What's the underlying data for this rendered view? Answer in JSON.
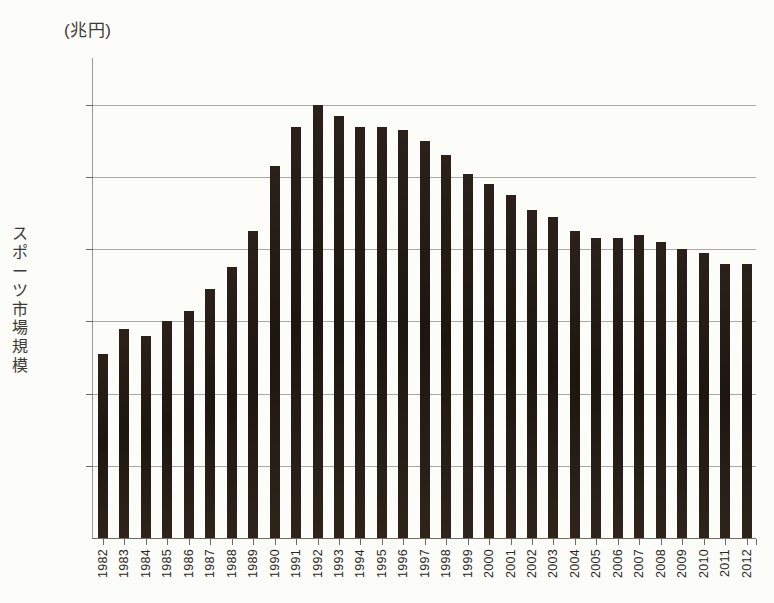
{
  "chart_data": {
    "type": "bar",
    "title": "",
    "unit_label": "(兆円)",
    "ylabel": "スポーツ市場規模",
    "xlabel": "",
    "grid": true,
    "legend": false,
    "ylim": [
      0,
      13.3
    ],
    "y_gridline_values": [
      2,
      4,
      6,
      8,
      10,
      12
    ],
    "y_tick_labels_shown": false,
    "categories": [
      "1982",
      "1983",
      "1984",
      "1985",
      "1986",
      "1987",
      "1988",
      "1989",
      "1990",
      "1991",
      "1992",
      "1993",
      "1994",
      "1995",
      "1996",
      "1997",
      "1998",
      "1999",
      "2000",
      "2001",
      "2002",
      "2003",
      "2004",
      "2005",
      "2006",
      "2007",
      "2008",
      "2009",
      "2010",
      "2011",
      "2012"
    ],
    "values": [
      5.1,
      5.8,
      5.6,
      6.0,
      6.3,
      6.9,
      7.5,
      8.5,
      10.3,
      11.4,
      12.0,
      11.7,
      11.4,
      11.4,
      11.3,
      11.0,
      10.6,
      10.1,
      9.8,
      9.5,
      9.1,
      8.9,
      8.5,
      8.3,
      8.3,
      8.4,
      8.2,
      8.0,
      7.9,
      7.6,
      7.6
    ],
    "bar_color": "#241c16",
    "axis_color": "#6d6b66",
    "gridline_color": "#aaa8a2",
    "background_color": "#fcfcf9"
  }
}
